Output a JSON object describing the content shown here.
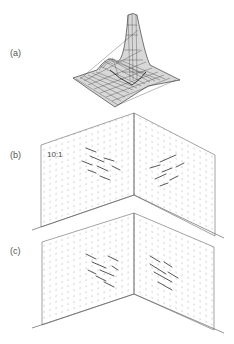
{
  "figure": {
    "panels": [
      {
        "label": "(a)",
        "kind": "3d-surface",
        "description": "wireframe surface with tall central peak and smaller side peak"
      },
      {
        "label": "(b)",
        "kind": "vector-field-on-orthogonal-planes",
        "scale_annotation": "10:1"
      },
      {
        "label": "(c)",
        "kind": "vector-field-on-orthogonal-planes"
      }
    ]
  },
  "colors": {
    "line": "#555555",
    "dots": "#8a8a8a",
    "vectors": "#444444",
    "mesh": "#333333"
  }
}
